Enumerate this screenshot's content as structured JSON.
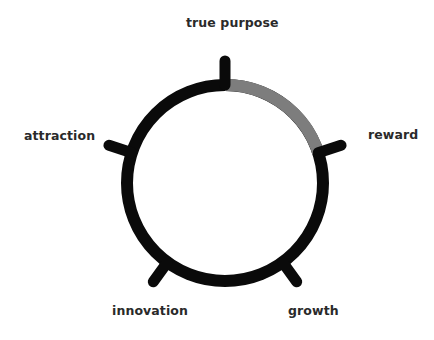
{
  "diagram": {
    "title": "",
    "center": {
      "x": 225,
      "y": 183
    },
    "radius": 98,
    "stroke_width": 12,
    "colors": {
      "ring": "#0a0a0a",
      "highlight": "#7d7d7d",
      "text": "#2a2a2a"
    },
    "highlight_arc": {
      "from_deg": 0,
      "to_deg": 72
    },
    "nodes": [
      {
        "label": "true purpose",
        "angle_deg": 0
      },
      {
        "label": "reward",
        "angle_deg": 72
      },
      {
        "label": "growth",
        "angle_deg": 144
      },
      {
        "label": "innovation",
        "angle_deg": 216
      },
      {
        "label": "attraction",
        "angle_deg": 288
      }
    ]
  }
}
